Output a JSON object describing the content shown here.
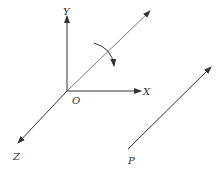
{
  "diagram": {
    "type": "3d-coordinate-axes-rotation",
    "colors": {
      "line": "#333333",
      "background": "#ffffff"
    },
    "labels": {
      "y_axis": "Y",
      "x_axis": "X",
      "z_axis": "Z",
      "origin": "O",
      "point": "P"
    },
    "elements": [
      {
        "name": "y-axis",
        "from": [
          67,
          91
        ],
        "to": [
          67,
          16
        ]
      },
      {
        "name": "x-axis",
        "from": [
          67,
          91
        ],
        "to": [
          141,
          91
        ]
      },
      {
        "name": "z-axis",
        "from": [
          67,
          91
        ],
        "to": [
          18,
          143
        ]
      },
      {
        "name": "rotation-axis",
        "from": [
          67,
          91
        ],
        "to": [
          150,
          11
        ]
      },
      {
        "name": "rotation-arrow",
        "from": [
          94,
          43
        ],
        "to": [
          114,
          67
        ],
        "direction": "clockwise"
      },
      {
        "name": "parallel-vector-p",
        "from": [
          128,
          149
        ],
        "to": [
          211,
          67
        ]
      }
    ]
  }
}
